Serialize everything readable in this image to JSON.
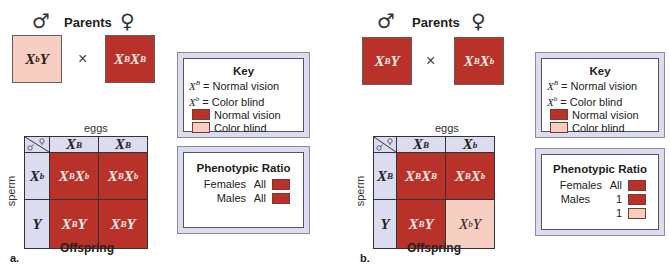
{
  "colors": {
    "normal_vision": "#b8322a",
    "color_blind": "#f6cfc2",
    "header_bg": "#dcdcf0"
  },
  "panels": [
    {
      "letter": "a.",
      "parents_label": "Parents",
      "male_symbol": "♂",
      "female_symbol": "♀",
      "cross_symbol": "×",
      "male_parent": {
        "base": "X",
        "sup": "b",
        "rest": "Y",
        "phenotype": "color_blind"
      },
      "female_parent": {
        "base": "X",
        "sup": "B",
        "rest": "X",
        "sup2": "B",
        "phenotype": "normal_vision"
      },
      "eggs_label": "eggs",
      "sperm_label": "sperm",
      "offspring_label": "Offspring",
      "egg_headers": [
        {
          "base": "X",
          "sup": "B"
        },
        {
          "base": "X",
          "sup": "B"
        }
      ],
      "sperm_headers": [
        {
          "base": "X",
          "sup": "b"
        },
        {
          "base": "Y",
          "sup": ""
        }
      ],
      "cells": [
        [
          {
            "g": "XBXb",
            "a": "X",
            "as": "B",
            "b": "X",
            "bs": "b",
            "phenotype": "normal_vision"
          },
          {
            "g": "XBXb",
            "a": "X",
            "as": "B",
            "b": "X",
            "bs": "b",
            "phenotype": "normal_vision"
          }
        ],
        [
          {
            "g": "XBY",
            "a": "X",
            "as": "B",
            "b": "Y",
            "bs": "",
            "phenotype": "normal_vision"
          },
          {
            "g": "XBY",
            "a": "X",
            "as": "B",
            "b": "Y",
            "bs": "",
            "phenotype": "normal_vision"
          }
        ]
      ],
      "key": {
        "title": "Key",
        "lines": [
          {
            "allele": "X",
            "sup": "B",
            "text": " = Normal vision"
          },
          {
            "allele": "X",
            "sup": "b",
            "text": " = Color blind"
          }
        ],
        "swatches": [
          {
            "phenotype": "normal_vision",
            "label": "Normal vision"
          },
          {
            "phenotype": "color_blind",
            "label": "Color blind"
          }
        ]
      },
      "ratio": {
        "title": "Phenotypic Ratio",
        "rows": [
          {
            "label": "Females",
            "value": "All",
            "phenotype": "normal_vision"
          },
          {
            "label": "Males",
            "value": "All",
            "phenotype": "normal_vision"
          }
        ]
      }
    },
    {
      "letter": "b.",
      "parents_label": "Parents",
      "male_symbol": "♂",
      "female_symbol": "♀",
      "cross_symbol": "×",
      "male_parent": {
        "base": "X",
        "sup": "B",
        "rest": "Y",
        "phenotype": "normal_vision"
      },
      "female_parent": {
        "base": "X",
        "sup": "B",
        "rest": "X",
        "sup2": "b",
        "phenotype": "normal_vision"
      },
      "eggs_label": "eggs",
      "sperm_label": "sperm",
      "offspring_label": "Offspring",
      "egg_headers": [
        {
          "base": "X",
          "sup": "B"
        },
        {
          "base": "X",
          "sup": "b"
        }
      ],
      "sperm_headers": [
        {
          "base": "X",
          "sup": "B"
        },
        {
          "base": "Y",
          "sup": ""
        }
      ],
      "cells": [
        [
          {
            "g": "XBXB",
            "a": "X",
            "as": "B",
            "b": "X",
            "bs": "B",
            "phenotype": "normal_vision"
          },
          {
            "g": "XBXb",
            "a": "X",
            "as": "B",
            "b": "X",
            "bs": "b",
            "phenotype": "normal_vision"
          }
        ],
        [
          {
            "g": "XBY",
            "a": "X",
            "as": "B",
            "b": "Y",
            "bs": "",
            "phenotype": "normal_vision"
          },
          {
            "g": "XbY",
            "a": "X",
            "as": "b",
            "b": "Y",
            "bs": "",
            "phenotype": "color_blind"
          }
        ]
      ],
      "key": {
        "title": "Key",
        "lines": [
          {
            "allele": "X",
            "sup": "B",
            "text": " = Normal vision"
          },
          {
            "allele": "X",
            "sup": "b",
            "text": " = Color blind"
          }
        ],
        "swatches": [
          {
            "phenotype": "normal_vision",
            "label": "Normal vision"
          },
          {
            "phenotype": "color_blind",
            "label": "Color blind"
          }
        ]
      },
      "ratio": {
        "title": "Phenotypic Ratio",
        "rows": [
          {
            "label": "Females",
            "value": "All",
            "phenotype": "normal_vision"
          },
          {
            "label": "Males",
            "value": "1",
            "phenotype": "normal_vision"
          },
          {
            "label": "",
            "value": "1",
            "phenotype": "color_blind"
          }
        ]
      }
    }
  ]
}
